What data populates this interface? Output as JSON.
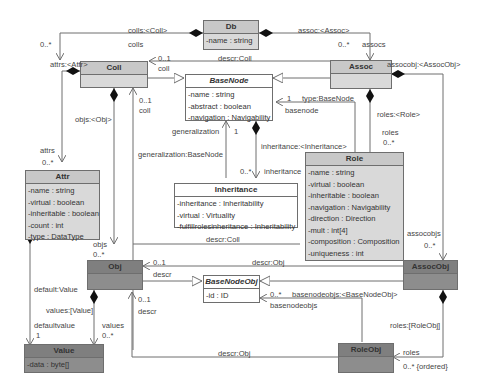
{
  "classes": {
    "db": {
      "name": "Db",
      "attrs": [
        "-name : string"
      ]
    },
    "coll": {
      "name": "Coll",
      "attrs": []
    },
    "assoc": {
      "name": "Assoc",
      "attrs": []
    },
    "basenode": {
      "name": "BaseNode",
      "attrs": [
        "-name : string",
        "-abstract : boolean",
        "-navigation : Navigability"
      ]
    },
    "attr": {
      "name": "Attr",
      "attrs": [
        "-name : string",
        "-virtual : boolean",
        "-inheritable : boolean",
        "-count : int",
        "-type : DataType"
      ]
    },
    "inheritance": {
      "name": "Inheritance",
      "attrs": [
        "-inheritance : Inheritability",
        "-virtual : Virtuality",
        "-fulfillrolesinheritance : Inheritability"
      ]
    },
    "role": {
      "name": "Role",
      "attrs": [
        "-name : string",
        "-virtual : boolean",
        "-inheritable : boolean",
        "-navigation : Navigability",
        "-direction : Direction",
        "-mult : int[4]",
        "-composition : Composition",
        "-uniqueness : int"
      ]
    },
    "obj": {
      "name": "Obj",
      "attrs": []
    },
    "basenodeobj": {
      "name": "BaseNodeObj",
      "attrs": [
        "-id : ID"
      ]
    },
    "assocobj": {
      "name": "AssocObj",
      "attrs": []
    },
    "value": {
      "name": "Value",
      "attrs": [
        "-data : byte[]"
      ]
    },
    "roleobj": {
      "name": "RoleObj",
      "attrs": []
    }
  },
  "labels": {
    "colls_coll": "colls:<Coll>",
    "colls_mult": "0..*",
    "colls_role": "colls",
    "assoc_assoc": "assoc:<Assoc>",
    "assoc_mult": "0..*",
    "assocs_role": "assocs",
    "descr_coll_top": "descr:Coll",
    "coll_mult_top": "0..1",
    "coll_role_top": "coll",
    "attrs_attr": "attrs:<Attr>",
    "attrs_role": "attrs",
    "attrs_mult": "0..*",
    "objs_obj": "objs:<Obj>",
    "coll_mult_mid": "0..1",
    "coll_role_mid": "coll",
    "type_basenode": "type:BaseNode",
    "basenode_mult": "1",
    "basenode_role": "basenode",
    "assocobj_assocobj": "assocobj:<AssocObj>",
    "roles_role": "roles:<Role>",
    "roles_role_end": "roles",
    "roles_mult": "0..*",
    "generalization_role": "generalization",
    "generalization_mult": "1",
    "generalization_basenode": "generalization:BaseNode",
    "inheritance_inh": "inheritance:<Inheritance>",
    "inheritance_mult": "0..*",
    "inheritance_role": "inheritance",
    "descr_coll_mid": "descr:Coll",
    "assocobjs_role": "assocobjs",
    "assocobjs_mult": "0..*",
    "objs_role": "objs",
    "objs_mult": "0..*",
    "descr_mult_1": "0..1",
    "descr_role_1": "descr",
    "descr_obj_1": "descr:Obj",
    "default_value": "default:Value",
    "values_value": "values:[Value]",
    "defaultvalue_role": "defaultvalue",
    "defaultvalue_mult": "1",
    "values_role": "values",
    "values_mult": "0..*",
    "descr_mult_2": "0..1",
    "descr_role_2": "descr",
    "basenodeobjs_mult": "0..*",
    "basenodeobjs_bno": "basenodeobjs:<BaseNodeObj>",
    "basenodeobjs_role": "basenodeobjs",
    "roles_roleobj": "roles:[RoleObj]",
    "roles_roleobj_role": "roles",
    "roles_roleobj_mult": "0..* {ordered}",
    "descr_obj_2": "descr:Obj"
  },
  "colors": {
    "light_fill": "#d9d9d9",
    "dark_fill": "#8d8d8d",
    "line": "#6e6e6e"
  }
}
